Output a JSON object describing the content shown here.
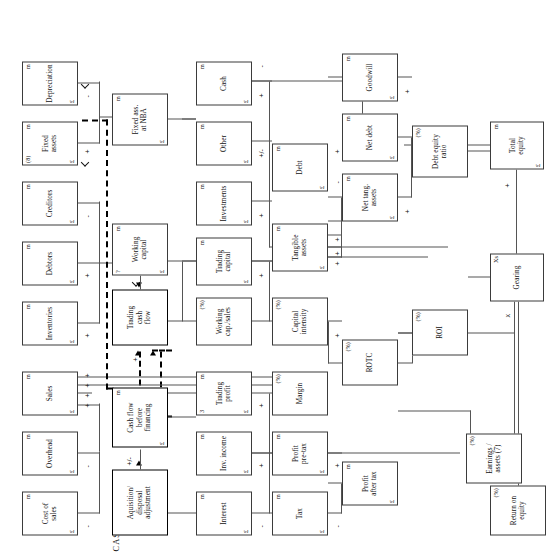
{
  "diagram": {
    "title": "CASH FLOW",
    "section_labels": [
      {
        "text": "CASH FLOW",
        "x": 6,
        "y": 112
      }
    ],
    "units": {
      "money": "£",
      "millions": "m",
      "percent": "(%)",
      "times": "Xs"
    },
    "nodes": [
      {
        "id": "cost_of_sales",
        "label": "Cost of\nsales",
        "tr": "m",
        "bl": "£",
        "x": 22,
        "y": 22,
        "w": 44,
        "h": 56,
        "bold": false
      },
      {
        "id": "overhead",
        "label": "Overhead",
        "tr": "m",
        "bl": "£",
        "x": 82,
        "y": 22,
        "w": 44,
        "h": 56,
        "bold": false
      },
      {
        "id": "sales",
        "label": "Sales",
        "tr": "m",
        "bl": "£",
        "x": 142,
        "y": 22,
        "w": 44,
        "h": 56,
        "bold": false
      },
      {
        "id": "inventories",
        "label": "Inventories",
        "tr": "m",
        "bl": "£",
        "x": 212,
        "y": 22,
        "w": 44,
        "h": 56,
        "bold": false
      },
      {
        "id": "debtors",
        "label": "Debtors",
        "tr": "m",
        "bl": "£",
        "x": 272,
        "y": 22,
        "w": 44,
        "h": 56,
        "bold": false
      },
      {
        "id": "creditors",
        "label": "Creditors",
        "tr": "m",
        "bl": "£",
        "x": 332,
        "y": 22,
        "w": 44,
        "h": 56,
        "bold": false
      },
      {
        "id": "fixed_assets",
        "label": "Fixed\nassets",
        "tr": "m",
        "tl": "(8)",
        "bl": "£",
        "x": 392,
        "y": 22,
        "w": 44,
        "h": 56,
        "bold": false
      },
      {
        "id": "depreciation",
        "label": "Depreciation",
        "tr": "m",
        "bl": "£",
        "x": 452,
        "y": 22,
        "w": 44,
        "h": 56,
        "bold": false
      },
      {
        "id": "acq_disp",
        "label": "Aquisition/\ndisposal\nadjustment",
        "x": 22,
        "y": 112,
        "w": 66,
        "h": 56,
        "bold": true
      },
      {
        "id": "cash_flow_bf",
        "label": "Cash flow\nbefore\nfinancing",
        "tr": "m",
        "bl": "£",
        "x": 110,
        "y": 112,
        "w": 60,
        "h": 56,
        "bold": true
      },
      {
        "id": "trading_cash_flow",
        "label": "Trading\ncash\nflow",
        "x": 212,
        "y": 112,
        "w": 56,
        "h": 56,
        "bold": true
      },
      {
        "id": "working_capital",
        "label": "Working\ncapital",
        "tr": "m",
        "tl": "?",
        "bl": "£",
        "x": 282,
        "y": 112,
        "w": 52,
        "h": 56,
        "bold": false
      },
      {
        "id": "fixed_ass_nba",
        "label": "Fixed ass.\nat NBA",
        "tr": "m",
        "bl": "£",
        "x": 412,
        "y": 112,
        "w": 52,
        "h": 56,
        "bold": false
      },
      {
        "id": "interest",
        "label": "Interest",
        "tr": "m",
        "bl": "£",
        "x": 22,
        "y": 196,
        "w": 44,
        "h": 56,
        "bold": false
      },
      {
        "id": "inv_income",
        "label": "Inv. income",
        "tr": "m",
        "bl": "£",
        "x": 82,
        "y": 196,
        "w": 44,
        "h": 56,
        "bold": false
      },
      {
        "id": "trading_profit",
        "label": "Trading\nprofit",
        "tr": "m",
        "tl": "3",
        "bl": "£",
        "x": 142,
        "y": 196,
        "w": 44,
        "h": 56,
        "bold": false
      },
      {
        "id": "working_cap_sales",
        "label": "Working\ncap./sales",
        "tr": "(%)",
        "x": 212,
        "y": 196,
        "w": 48,
        "h": 56,
        "bold": false
      },
      {
        "id": "trading_capital",
        "label": "Trading\ncapital",
        "tr": "m",
        "bl": "£",
        "x": 272,
        "y": 196,
        "w": 48,
        "h": 56,
        "bold": false
      },
      {
        "id": "investments",
        "label": "Investments",
        "tr": "m",
        "bl": "£",
        "x": 332,
        "y": 196,
        "w": 44,
        "h": 56,
        "bold": false
      },
      {
        "id": "other",
        "label": "Other",
        "tr": "m",
        "bl": "£",
        "x": 392,
        "y": 196,
        "w": 44,
        "h": 56,
        "bold": false
      },
      {
        "id": "cash",
        "label": "Cash",
        "tr": "m",
        "bl": "£",
        "x": 452,
        "y": 196,
        "w": 44,
        "h": 56,
        "bold": false
      },
      {
        "id": "tax",
        "label": "Tax",
        "tr": "m",
        "bl": "£",
        "x": 22,
        "y": 272,
        "w": 44,
        "h": 56,
        "bold": false
      },
      {
        "id": "profit_pre_tax",
        "label": "Profit\npre-tax",
        "tr": "m",
        "bl": "£",
        "x": 82,
        "y": 272,
        "w": 44,
        "h": 56,
        "bold": false
      },
      {
        "id": "margin",
        "label": "Margin",
        "tr": "(%)",
        "x": 142,
        "y": 272,
        "w": 44,
        "h": 56,
        "bold": false
      },
      {
        "id": "capital_intensity",
        "label": "Capital\nintensity",
        "tr": "(%)",
        "x": 212,
        "y": 272,
        "w": 48,
        "h": 56,
        "bold": false
      },
      {
        "id": "tangible_assets",
        "label": "Tangible\nassets",
        "tr": "m",
        "bl": "£",
        "x": 286,
        "y": 272,
        "w": 48,
        "h": 56,
        "bold": false
      },
      {
        "id": "debt",
        "label": "Debt",
        "tr": "m",
        "bl": "£",
        "x": 366,
        "y": 272,
        "w": 48,
        "h": 56,
        "bold": false
      },
      {
        "id": "profit_after_tax",
        "label": "Profit\nafter tax",
        "tr": "m",
        "bl": "£",
        "x": 52,
        "y": 342,
        "w": 44,
        "h": 56,
        "bold": false
      },
      {
        "id": "rotc",
        "label": "ROTC",
        "tr": "(%)",
        "x": 172,
        "y": 342,
        "w": 46,
        "h": 56,
        "bold": false
      },
      {
        "id": "net_tang_assets",
        "label": "Net tang.\nassets",
        "tr": "m",
        "bl": "£",
        "x": 336,
        "y": 342,
        "w": 48,
        "h": 56,
        "bold": false
      },
      {
        "id": "net_debt",
        "label": "Net debt",
        "tr": "m",
        "bl": "£",
        "x": 396,
        "y": 342,
        "w": 48,
        "h": 56,
        "bold": false
      },
      {
        "id": "goodwill",
        "label": "Goodwill",
        "tr": "m",
        "bl": "£",
        "x": 456,
        "y": 342,
        "w": 48,
        "h": 56,
        "bold": false
      },
      {
        "id": "roi",
        "label": "ROI",
        "tr": "(%)",
        "x": 202,
        "y": 412,
        "w": 46,
        "h": 56,
        "bold": false
      },
      {
        "id": "debt_equity_ratio",
        "label": "Debt equity\nratio",
        "tr": "(%)",
        "x": 380,
        "y": 412,
        "w": 52,
        "h": 56,
        "bold": false
      },
      {
        "id": "earnings_assets",
        "label": "Earnings /\nassets (7)",
        "tr": "(%)",
        "x": 74,
        "y": 466,
        "w": 50,
        "h": 56,
        "bold": false
      },
      {
        "id": "return_on_equity",
        "label": "Return on\nequity",
        "tr": "(%)",
        "x": 22,
        "y": 490,
        "w": 50,
        "h": 56,
        "bold": false
      },
      {
        "id": "gearing",
        "label": "Gearing",
        "tr": "Xs",
        "x": 256,
        "y": 490,
        "w": 48,
        "h": 54,
        "bold": false
      },
      {
        "id": "total_equity",
        "label": "Total\nequity",
        "tr": "m",
        "bl": "£",
        "x": 388,
        "y": 490,
        "w": 48,
        "h": 54,
        "bold": false
      }
    ],
    "signs": [
      {
        "t": "-",
        "x": 30,
        "y": 84
      },
      {
        "t": "-",
        "x": 90,
        "y": 84
      },
      {
        "t": "+",
        "x": 150,
        "y": 84
      },
      {
        "t": "+",
        "x": 160,
        "y": 84
      },
      {
        "t": "+",
        "x": 170,
        "y": 84
      },
      {
        "t": "+",
        "x": 180,
        "y": 84
      },
      {
        "t": "+",
        "x": 220,
        "y": 84
      },
      {
        "t": "+",
        "x": 280,
        "y": 84
      },
      {
        "t": "-",
        "x": 340,
        "y": 84
      },
      {
        "t": "+",
        "x": 404,
        "y": 84
      },
      {
        "t": "-",
        "x": 460,
        "y": 84
      },
      {
        "t": "+/-",
        "x": 92,
        "y": 126
      },
      {
        "t": "+",
        "x": 196,
        "y": 132
      },
      {
        "t": "-",
        "x": 30,
        "y": 258
      },
      {
        "t": "+",
        "x": 90,
        "y": 258
      },
      {
        "t": "+",
        "x": 150,
        "y": 258
      },
      {
        "t": "+",
        "x": 280,
        "y": 258
      },
      {
        "t": "+",
        "x": 340,
        "y": 258
      },
      {
        "t": "+/-",
        "x": 400,
        "y": 258
      },
      {
        "t": "+",
        "x": 460,
        "y": 258
      },
      {
        "t": "-",
        "x": 490,
        "y": 258
      },
      {
        "t": "-",
        "x": 30,
        "y": 334
      },
      {
        "t": "+",
        "x": 90,
        "y": 334
      },
      {
        "t": "+",
        "x": 220,
        "y": 334
      },
      {
        "t": "+",
        "x": 292,
        "y": 334
      },
      {
        "t": "+",
        "x": 302,
        "y": 334
      },
      {
        "t": "+",
        "x": 316,
        "y": 334
      },
      {
        "t": "-",
        "x": 374,
        "y": 334
      },
      {
        "t": "+",
        "x": 404,
        "y": 334
      },
      {
        "t": "+",
        "x": 344,
        "y": 404
      },
      {
        "t": "+",
        "x": 464,
        "y": 404
      },
      {
        "t": "x",
        "x": 240,
        "y": 504
      },
      {
        "t": "+",
        "x": 370,
        "y": 504
      }
    ],
    "notes": [
      "Units column: £ m per box",
      "Ratio boxes shown as (%)",
      "Gearing expressed in Xs"
    ]
  }
}
